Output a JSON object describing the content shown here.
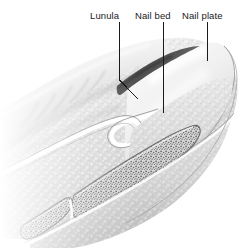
{
  "figure": {
    "style": "grayscale medical line drawing with stippled shading",
    "background_color": "#ffffff",
    "line_color": "#1a1a1a",
    "label_color": "#1a1a1a",
    "width": 250,
    "height": 248
  },
  "labels": [
    {
      "id": "lunula",
      "text": "Lunula",
      "leader": {
        "type": "bent",
        "points": [
          [
            119,
            22
          ],
          [
            119,
            80
          ],
          [
            138,
            99
          ]
        ]
      }
    },
    {
      "id": "nail_bed",
      "text": "Nail bed",
      "leader": {
        "type": "straight",
        "points": [
          [
            163,
            22
          ],
          [
            163,
            113
          ]
        ]
      }
    },
    {
      "id": "nail_plate",
      "text": "Nail plate",
      "leader": {
        "type": "straight",
        "points": [
          [
            207,
            22
          ],
          [
            207,
            61
          ]
        ]
      }
    }
  ],
  "structures": [
    {
      "id": "finger_body",
      "name": "Distal phalanx soft tissue",
      "fill": "#e8e8e8"
    },
    {
      "id": "nail_plate_surface",
      "name": "Nail plate",
      "fill": "#efefef"
    },
    {
      "id": "nail_plate_shadow",
      "name": "Proximal nail plate in shadow",
      "fill": "#4a4a4a"
    },
    {
      "id": "nail_fold",
      "name": "Proximal nail fold / cuticle",
      "fill": "#ffffff"
    },
    {
      "id": "nail_bed_tissue",
      "name": "Nail bed",
      "fill": "#dcdcdc"
    },
    {
      "id": "bone_distal",
      "name": "Distal phalanx bone",
      "fill": "#c9c9c9"
    },
    {
      "id": "bone_joint",
      "name": "Adjacent phalanx bone",
      "fill": "#c9c9c9"
    },
    {
      "id": "skin_surface",
      "name": "Skin with creases",
      "fill": "#d8d8d8"
    }
  ]
}
